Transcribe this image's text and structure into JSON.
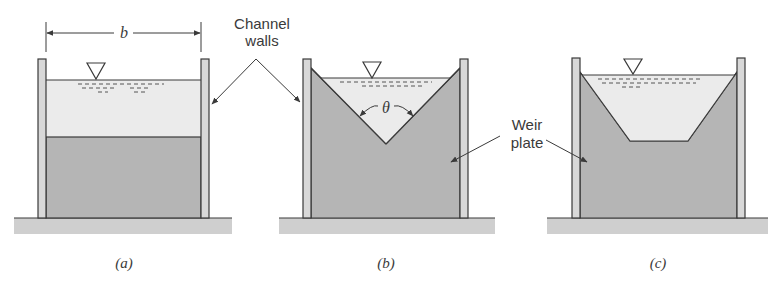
{
  "figure": {
    "panels": [
      {
        "id": "a",
        "caption": "(a)",
        "weir_type": "rectangular broad"
      },
      {
        "id": "b",
        "caption": "(b)",
        "weir_type": "triangular V-notch"
      },
      {
        "id": "c",
        "caption": "(c)",
        "weir_type": "trapezoidal"
      }
    ],
    "labels": {
      "channel_walls_line1": "Channel",
      "channel_walls_line2": "walls",
      "weir_plate_line1": "Weir",
      "weir_plate_line2": "plate",
      "width_symbol": "b",
      "angle_symbol": "θ"
    },
    "colors": {
      "water": "#ebebeb",
      "weir_plate": "#b5b5b5",
      "wall": "#d8d8d8",
      "ground": "#cfcfcf",
      "stroke": "#3a3a3a"
    }
  }
}
